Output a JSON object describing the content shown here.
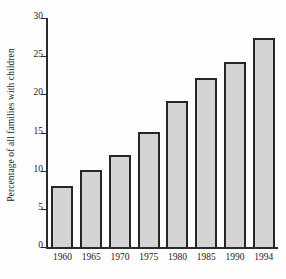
{
  "chart_data": {
    "type": "bar",
    "title": "",
    "xlabel": "",
    "ylabel": "Percentage of all families with children",
    "categories": [
      "1960",
      "1965",
      "1970",
      "1975",
      "1980",
      "1985",
      "1990",
      "1994"
    ],
    "values": [
      8.0,
      10.1,
      12.0,
      15.1,
      19.1,
      22.1,
      24.3,
      27.4
    ],
    "ylim": [
      0,
      30
    ],
    "yticks": [
      0,
      5,
      10,
      15,
      20,
      25,
      30
    ],
    "ytick_labels": [
      "0",
      "5",
      "10",
      "15",
      "20",
      "25",
      "30"
    ],
    "grid": false,
    "legend": "none",
    "bar_fill_color": "#d4d4d4",
    "bar_edge_color": "#262626",
    "axis_color": "#2b2b2b",
    "background_color": "#fdfdfd"
  }
}
